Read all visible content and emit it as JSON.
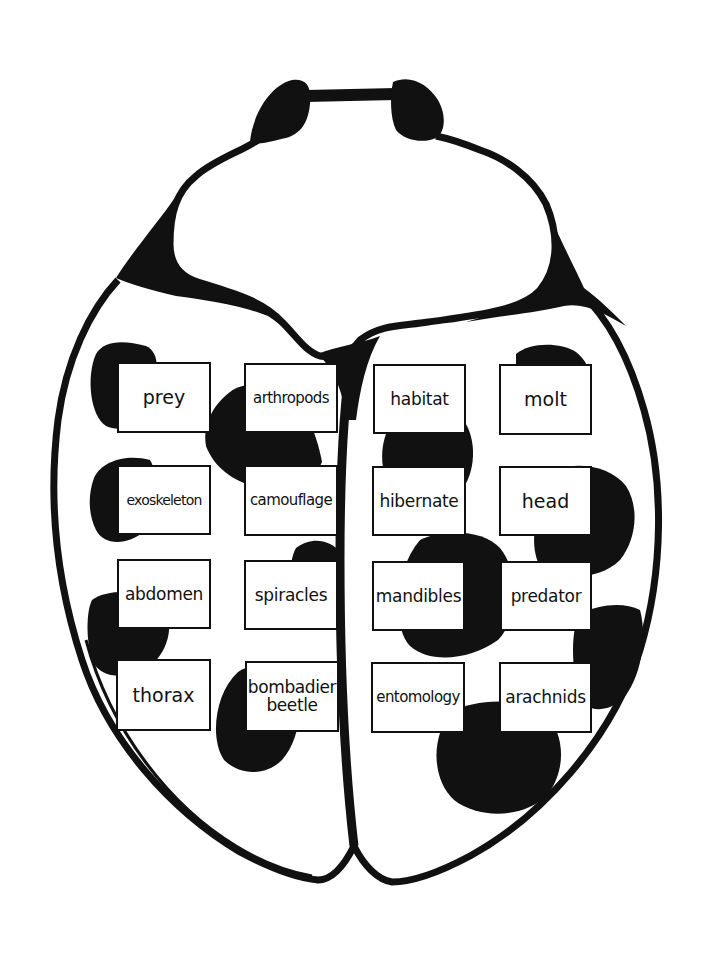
{
  "diagram": {
    "colors": {
      "ink": "#111111",
      "paper": "#ffffff"
    }
  },
  "cards": [
    {
      "id": "prey",
      "label": "prey",
      "x": 117,
      "y": 362,
      "w": 94,
      "h": 71,
      "size": "fs-big"
    },
    {
      "id": "arthropods",
      "label": "arthropods",
      "x": 244,
      "y": 363,
      "w": 94,
      "h": 70,
      "size": "fs-small"
    },
    {
      "id": "habitat",
      "label": "habitat",
      "x": 373,
      "y": 364,
      "w": 93,
      "h": 70,
      "size": "fs-mid"
    },
    {
      "id": "molt",
      "label": "molt",
      "x": 499,
      "y": 364,
      "w": 93,
      "h": 71,
      "size": "fs-big"
    },
    {
      "id": "exoskeleton",
      "label": "exoskeleton",
      "x": 117,
      "y": 465,
      "w": 94,
      "h": 70,
      "size": "fs-tiny"
    },
    {
      "id": "camouflage",
      "label": "camouflage",
      "x": 244,
      "y": 465,
      "w": 94,
      "h": 71,
      "size": "fs-small"
    },
    {
      "id": "hibernate",
      "label": "hibernate",
      "x": 372,
      "y": 466,
      "w": 94,
      "h": 70,
      "size": "fs-mid"
    },
    {
      "id": "head",
      "label": "head",
      "x": 499,
      "y": 466,
      "w": 93,
      "h": 70,
      "size": "fs-big"
    },
    {
      "id": "abdomen",
      "label": "abdomen",
      "x": 117,
      "y": 559,
      "w": 94,
      "h": 70,
      "size": "fs-mid"
    },
    {
      "id": "spiracles",
      "label": "spiracles",
      "x": 244,
      "y": 560,
      "w": 94,
      "h": 70,
      "size": "fs-mid"
    },
    {
      "id": "mandibles",
      "label": "mandibles",
      "x": 372,
      "y": 561,
      "w": 93,
      "h": 70,
      "size": "fs-mid"
    },
    {
      "id": "predator",
      "label": "predator",
      "x": 500,
      "y": 561,
      "w": 92,
      "h": 70,
      "size": "fs-mid"
    },
    {
      "id": "thorax",
      "label": "thorax",
      "x": 116,
      "y": 659,
      "w": 95,
      "h": 72,
      "size": "fs-big"
    },
    {
      "id": "bombadier-beetle",
      "label": "bombadier\nbeetle",
      "x": 245,
      "y": 661,
      "w": 94,
      "h": 71,
      "size": "fs-two"
    },
    {
      "id": "entomology",
      "label": "entomology",
      "x": 371,
      "y": 662,
      "w": 94,
      "h": 71,
      "size": "fs-small"
    },
    {
      "id": "arachnids",
      "label": "arachnids",
      "x": 499,
      "y": 662,
      "w": 93,
      "h": 71,
      "size": "fs-mid"
    }
  ]
}
